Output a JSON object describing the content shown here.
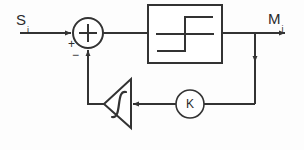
{
  "diagram": {
    "type": "control-block-diagram",
    "title": "",
    "background_color": "#fdfdfd",
    "line_color": "#333333",
    "text_color": "#2b2b2b",
    "signals": {
      "input": {
        "base": "S",
        "subscript": "i"
      },
      "output": {
        "base": "M",
        "subscript": "i"
      }
    },
    "summing_junction": {
      "symbol": "+",
      "input_sign": "+",
      "feedback_sign": "−",
      "cx": 88,
      "cy": 33,
      "r": 15
    },
    "blocks": [
      {
        "name": "hysteresis-relay",
        "shape": "rectangle",
        "symbol": "hysteresis",
        "x": 148,
        "y": 5,
        "width": 74,
        "height": 58
      },
      {
        "name": "saturation-amplifier",
        "shape": "triangle-left",
        "symbol": "saturation",
        "apex_x": 104,
        "apex_y": 104,
        "right_x": 131,
        "top_y": 79,
        "bottom_y": 128
      },
      {
        "name": "gain",
        "shape": "circle",
        "label": "K",
        "cx": 190,
        "cy": 104,
        "r": 14
      }
    ],
    "connections": [
      {
        "name": "input-to-sum",
        "from": "S_i",
        "to": "summing-junction"
      },
      {
        "name": "sum-to-relay",
        "from": "summing-junction",
        "to": "hysteresis-relay"
      },
      {
        "name": "relay-to-output",
        "from": "hysteresis-relay",
        "to": "M_i"
      },
      {
        "name": "output-tap-to-gain",
        "from": "output-node",
        "to": "gain"
      },
      {
        "name": "gain-to-saturation",
        "from": "gain",
        "to": "saturation-amplifier"
      },
      {
        "name": "saturation-to-sum",
        "from": "saturation-amplifier",
        "to": "summing-junction"
      }
    ]
  }
}
